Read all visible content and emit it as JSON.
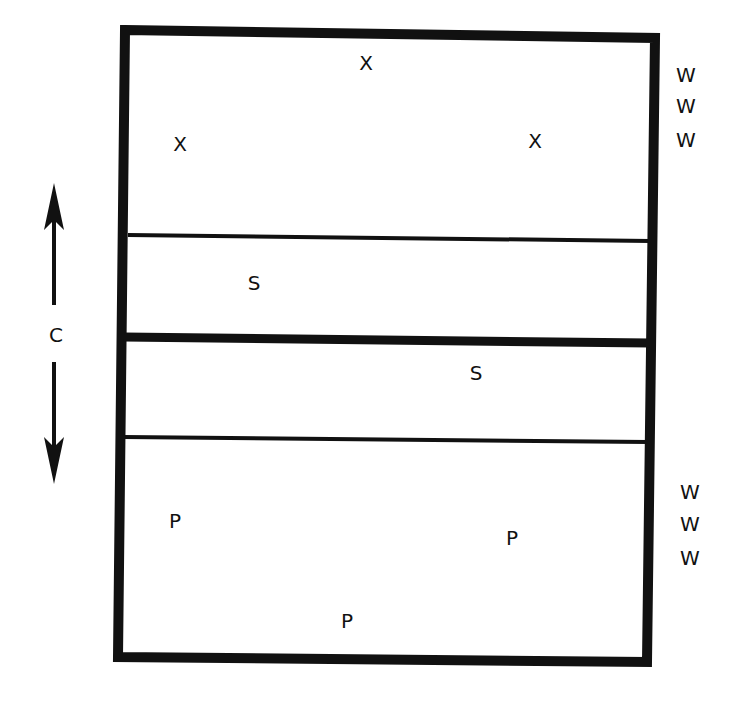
{
  "diagram": {
    "type": "court-layout",
    "zones": [
      {
        "name": "top-zone",
        "markers": [
          {
            "label": "X",
            "x": 366,
            "y": 70
          },
          {
            "label": "X",
            "x": 180,
            "y": 151
          },
          {
            "label": "X",
            "x": 535,
            "y": 148
          }
        ]
      },
      {
        "name": "upper-middle-zone",
        "markers": [
          {
            "label": "S",
            "x": 254,
            "y": 290
          }
        ]
      },
      {
        "name": "lower-middle-zone",
        "markers": [
          {
            "label": "S",
            "x": 476,
            "y": 380
          }
        ]
      },
      {
        "name": "bottom-zone",
        "markers": [
          {
            "label": "P",
            "x": 175,
            "y": 528
          },
          {
            "label": "P",
            "x": 512,
            "y": 545
          },
          {
            "label": "P",
            "x": 347,
            "y": 628
          }
        ]
      }
    ],
    "waiting_top": [
      "W",
      "W",
      "W"
    ],
    "waiting_bottom": [
      "W",
      "W",
      "W"
    ],
    "axis_label": "C",
    "colors": {
      "line": "#111111",
      "background": "#ffffff"
    }
  }
}
